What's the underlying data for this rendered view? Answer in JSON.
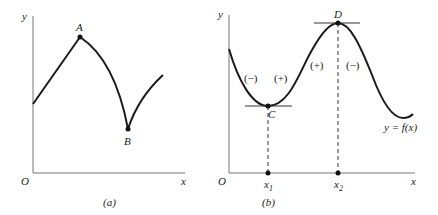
{
  "panel_a": {
    "caption": "(a)",
    "axis_y": "y",
    "axis_x": "x",
    "origin": "O",
    "point_a": "A",
    "point_b": "B"
  },
  "panel_b": {
    "caption": "(b)",
    "axis_y": "y",
    "axis_x": "x",
    "origin": "O",
    "point_c": "C",
    "point_d": "D",
    "function_label": "y = f(x)",
    "tick_x1": "x",
    "tick_x1_sub": "1",
    "tick_x2": "x",
    "tick_x2_sub": "2",
    "signs": [
      "(−)",
      "(+)",
      "(+)",
      "(−)"
    ]
  },
  "colors": {
    "axis": "#777777",
    "curve": "#1a1a1a"
  }
}
